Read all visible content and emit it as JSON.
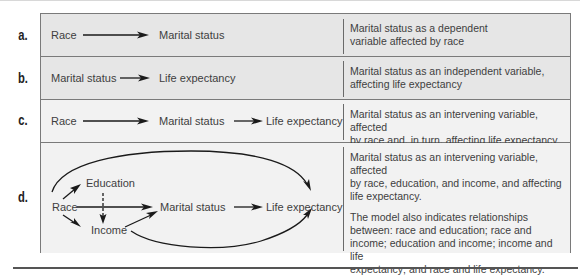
{
  "rows": [
    {
      "label": "a.",
      "nodes": [
        "Race",
        "Marital status"
      ],
      "description": [
        "Marital status as a dependent",
        "variable affected by race"
      ]
    },
    {
      "label": "b.",
      "nodes": [
        "Marital status",
        "Life expectancy"
      ],
      "description": [
        "Marital status as an independent variable,",
        "affecting life expectancy"
      ]
    },
    {
      "label": "c.",
      "nodes": [
        "Race",
        "Marital status",
        "Life expectancy"
      ],
      "description": [
        "Marital status as an intervening variable, affected",
        "by race and, in turn, affecting life expectancy"
      ]
    },
    {
      "label": "d.",
      "nodes": {
        "race": "Race",
        "education": "Education",
        "income": "Income",
        "marital": "Marital status",
        "life": "Life expectancy"
      },
      "description": [
        "Marital status as an intervening variable, affected",
        "by race, education, and income, and affecting",
        "life expectancy."
      ],
      "description2": [
        "The model also indicates relationships",
        "between: race and education; race and",
        "income; education and income; income and life",
        "expectancy; and race and life expectancy."
      ]
    }
  ],
  "colors": {
    "row_dark": "#e6e6e6",
    "row_light": "#f2f2f2",
    "border": "#7a7a7a",
    "arrow": "#1a1a1a"
  }
}
